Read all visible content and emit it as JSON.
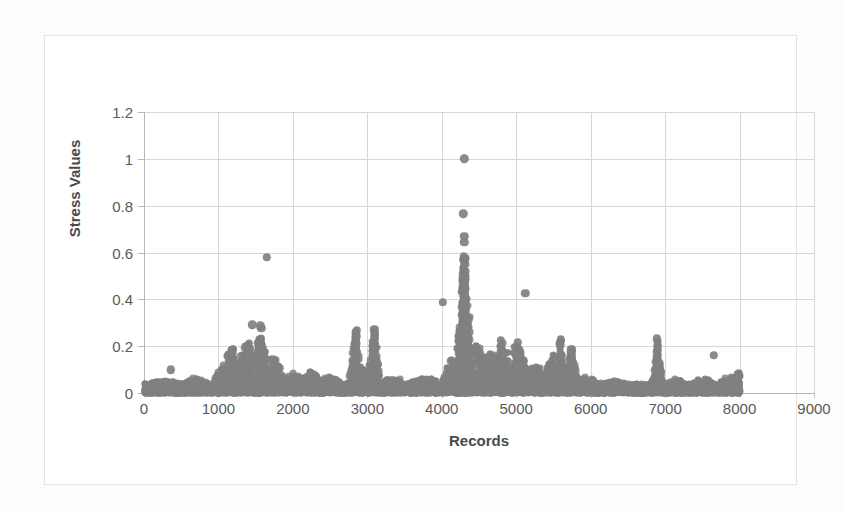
{
  "chart_data": {
    "type": "scatter",
    "title": "",
    "xlabel": "Records",
    "ylabel": "Stress Values",
    "xlim": [
      0,
      9000
    ],
    "ylim": [
      0,
      1.2
    ],
    "grid": true,
    "legend": null,
    "marker_color": "#808080",
    "marker_shape": "circle",
    "gridline_color": "#d7d7d7",
    "axis_color": "#b8b8b8",
    "x_ticks": [
      0,
      1000,
      2000,
      3000,
      4000,
      5000,
      6000,
      7000,
      8000,
      9000
    ],
    "x_tick_labels": [
      "0",
      "1000",
      "2000",
      "3000",
      "4000",
      "5000",
      "6000",
      "7000",
      "8000",
      "9000"
    ],
    "y_ticks": [
      0,
      0.2,
      0.4,
      0.6,
      0.8,
      1,
      1.2
    ],
    "y_tick_labels": [
      "0",
      "0.2",
      "0.4",
      "0.6",
      "0.8",
      "1",
      "1.2"
    ],
    "notable_points": [
      {
        "x": 4300,
        "y": 1.0,
        "note": "global maximum, isolated"
      },
      {
        "x": 4290,
        "y": 0.765,
        "note": "second highest"
      },
      {
        "x": 4300,
        "y": 0.67
      },
      {
        "x": 4300,
        "y": 0.645
      },
      {
        "x": 4295,
        "y": 0.585
      },
      {
        "x": 1650,
        "y": 0.58,
        "note": "isolated outlier left region"
      },
      {
        "x": 5120,
        "y": 0.425,
        "note": "isolated outlier right of main peak"
      },
      {
        "x": 4010,
        "y": 0.388,
        "note": "isolated outlier left of main peak"
      },
      {
        "x": 1455,
        "y": 0.292
      },
      {
        "x": 1560,
        "y": 0.288
      },
      {
        "x": 1575,
        "y": 0.278
      },
      {
        "x": 3095,
        "y": 0.272
      },
      {
        "x": 2855,
        "y": 0.268
      },
      {
        "x": 6890,
        "y": 0.232
      },
      {
        "x": 5600,
        "y": 0.228
      },
      {
        "x": 4790,
        "y": 0.225
      },
      {
        "x": 5020,
        "y": 0.218
      },
      {
        "x": 1190,
        "y": 0.188
      },
      {
        "x": 5740,
        "y": 0.188
      },
      {
        "x": 6905,
        "y": 0.185
      },
      {
        "x": 7650,
        "y": 0.162
      },
      {
        "x": 5760,
        "y": 0.132
      },
      {
        "x": 360,
        "y": 0.1,
        "note": "isolated early outlier"
      },
      {
        "x": 7990,
        "y": 0.085
      }
    ],
    "clusters": [
      {
        "x_range": [
          0,
          900
        ],
        "baseline_max": 0.05,
        "note": "low flat band near zero"
      },
      {
        "x_range": [
          900,
          1800
        ],
        "baseline_max": 0.22,
        "note": "first broad elevated cluster"
      },
      {
        "x_range": [
          1800,
          2600
        ],
        "baseline_max": 0.1
      },
      {
        "x_range": [
          2600,
          3200
        ],
        "baseline_max": 0.27,
        "note": "two narrow spikes near 2850 and 3100"
      },
      {
        "x_range": [
          3200,
          4100
        ],
        "baseline_max": 0.07
      },
      {
        "x_range": [
          4100,
          4500
        ],
        "baseline_max": 1.0,
        "note": "dominant narrow peak near 4300"
      },
      {
        "x_range": [
          4500,
          5900
        ],
        "baseline_max": 0.23,
        "note": "broad moderately elevated region"
      },
      {
        "x_range": [
          5900,
          6800
        ],
        "baseline_max": 0.06
      },
      {
        "x_range": [
          6800,
          7050
        ],
        "baseline_max": 0.23,
        "note": "narrow spike near 6900"
      },
      {
        "x_range": [
          7050,
          8000
        ],
        "baseline_max": 0.09
      }
    ]
  }
}
